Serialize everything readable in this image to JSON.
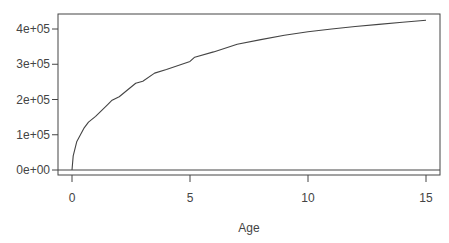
{
  "chart_data": {
    "type": "line",
    "title": "",
    "xlabel": "Age",
    "ylabel": "",
    "xlim": [
      0,
      15
    ],
    "ylim": [
      0,
      425000
    ],
    "x_ticks": [
      0,
      5,
      10,
      15
    ],
    "x_tick_labels": [
      "0",
      "5",
      "10",
      "15"
    ],
    "y_ticks": [
      0,
      100000,
      200000,
      300000,
      400000
    ],
    "y_tick_labels": [
      "0e+00",
      "1e+05",
      "2e+05",
      "3e+05",
      "4e+05"
    ],
    "grid": false,
    "legend": null,
    "reference_lines": [
      {
        "type": "horizontal",
        "y": 0
      }
    ],
    "series": [
      {
        "name": "curve",
        "color": "#444444",
        "x": [
          0,
          0.05,
          0.2,
          0.5,
          0.7,
          1,
          1.5,
          1.7,
          2,
          2.7,
          3,
          3.5,
          4,
          5,
          5.2,
          6,
          7,
          8,
          9,
          10,
          11,
          12,
          13,
          14,
          15
        ],
        "y": [
          0,
          40000,
          80000,
          118000,
          136000,
          152000,
          185000,
          198000,
          208000,
          246000,
          252000,
          275000,
          285000,
          308000,
          320000,
          335000,
          357000,
          370000,
          382000,
          392000,
          400000,
          407000,
          413000,
          419000,
          425000
        ]
      }
    ]
  }
}
